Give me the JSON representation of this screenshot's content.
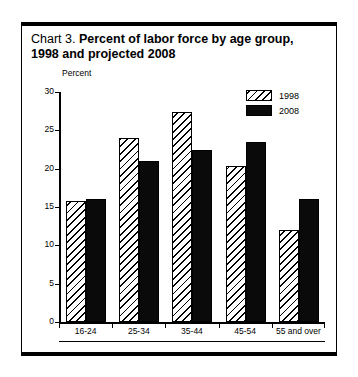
{
  "figure": {
    "title_prefix": "Chart 3. ",
    "title_main": "Percent of labor force by age group, 1998 and projected 2008",
    "axis_unit_label": "Percent"
  },
  "legend": {
    "entries": [
      {
        "label": "1998",
        "swatch": "hatched-swatch"
      },
      {
        "label": "2008",
        "swatch": "solid-black-swatch"
      }
    ]
  },
  "axis": {
    "y_ticks": [
      "30",
      "25",
      "20",
      "15",
      "10",
      "5",
      "0"
    ]
  },
  "colors": {
    "series_1998": "#ffffff",
    "series_2008": "#0a0a0a",
    "axis": "#000000",
    "frame": "#000000"
  },
  "chart_data": {
    "type": "bar",
    "title": "Chart 3. Percent of labor force by age group, 1998 and projected 2008",
    "xlabel": "",
    "ylabel": "Percent",
    "ylim": [
      0,
      30
    ],
    "ytick_step": 5,
    "grid": false,
    "legend_position": "top-right",
    "categories": [
      "16-24",
      "25-34",
      "35-44",
      "45-54",
      "55 and over"
    ],
    "series": [
      {
        "name": "1998",
        "values": [
          15.8,
          24.0,
          27.4,
          20.3,
          12.0
        ]
      },
      {
        "name": "2008",
        "values": [
          16.1,
          21.0,
          22.4,
          23.5,
          16.0
        ]
      }
    ]
  }
}
